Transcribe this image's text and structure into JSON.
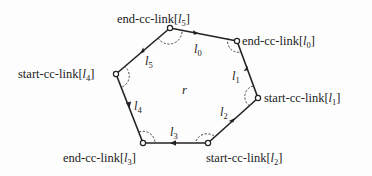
{
  "diagram": {
    "region_label": "r",
    "colors": {
      "stroke": "#222222",
      "background": "#fdfdfd"
    },
    "vertices": [
      {
        "id": "v0",
        "label_prefix": "end-cc-link[",
        "label_var": "l",
        "label_sub": "0",
        "label_suffix": "]"
      },
      {
        "id": "v1",
        "label_prefix": "start-cc-link[",
        "label_var": "l",
        "label_sub": "1",
        "label_suffix": "]"
      },
      {
        "id": "v2",
        "label_prefix": "start-cc-link[",
        "label_var": "l",
        "label_sub": "2",
        "label_suffix": "]"
      },
      {
        "id": "v3",
        "label_prefix": "end-cc-link[",
        "label_var": "l",
        "label_sub": "3",
        "label_suffix": "]"
      },
      {
        "id": "v4",
        "label_prefix": "start-cc-link[",
        "label_var": "l",
        "label_sub": "4",
        "label_suffix": "]"
      },
      {
        "id": "v5",
        "label_prefix": "end-cc-link[",
        "label_var": "l",
        "label_sub": "5",
        "label_suffix": "]"
      }
    ],
    "edges": [
      {
        "var": "l",
        "sub": "0"
      },
      {
        "var": "l",
        "sub": "1"
      },
      {
        "var": "l",
        "sub": "2"
      },
      {
        "var": "l",
        "sub": "3"
      },
      {
        "var": "l",
        "sub": "4"
      },
      {
        "var": "l",
        "sub": "5"
      }
    ]
  }
}
